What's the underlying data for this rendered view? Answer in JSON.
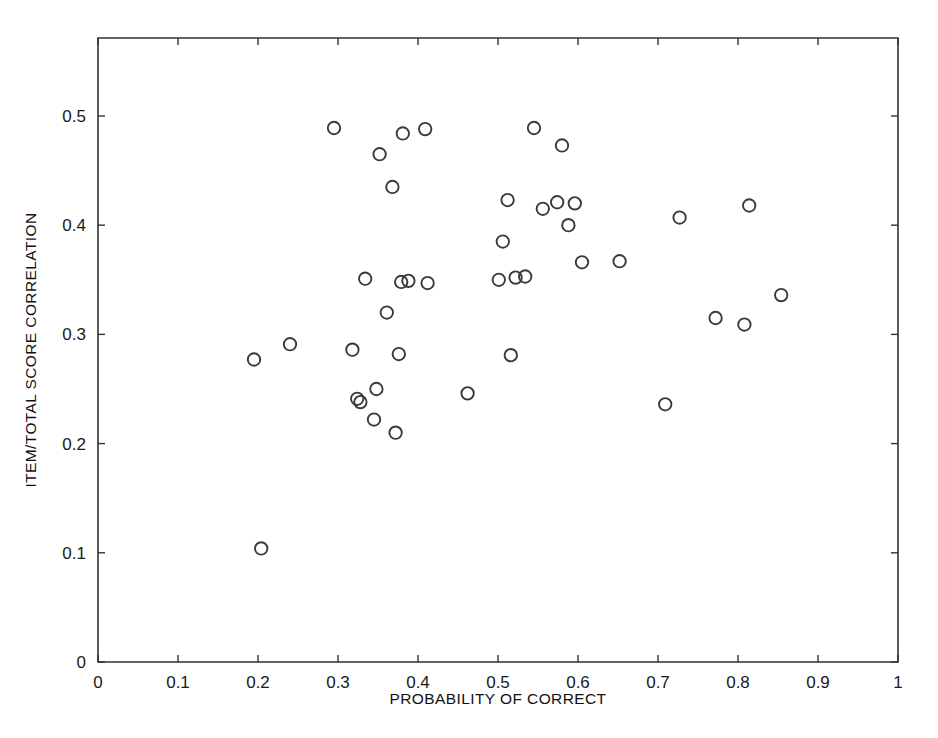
{
  "chart_data": {
    "type": "scatter",
    "title": "",
    "xlabel": "PROBABILITY OF CORRECT",
    "ylabel": "ITEM/TOTAL SCORE CORRELATION",
    "xlim": [
      0,
      1
    ],
    "ylim": [
      0,
      0.5714
    ],
    "grid": false,
    "legend": null,
    "marker": "open-circle",
    "marker_color": "#3a3a3a",
    "xticks": [
      0,
      0.1,
      0.2,
      0.3,
      0.4,
      0.5,
      0.6,
      0.7,
      0.8,
      0.9,
      1
    ],
    "xtick_labels": [
      "0",
      "0.1",
      "0.2",
      "0.3",
      "0.4",
      "0.5",
      "0.6",
      "0.7",
      "0.8",
      "0.9",
      "1"
    ],
    "yticks": [
      0,
      0.1,
      0.2,
      0.3,
      0.4,
      0.5
    ],
    "ytick_labels": [
      "0",
      "0.1",
      "0.2",
      "0.3",
      "0.4",
      "0.5"
    ],
    "n_points": 41,
    "x": [
      0.195,
      0.204,
      0.24,
      0.295,
      0.318,
      0.324,
      0.328,
      0.334,
      0.345,
      0.348,
      0.352,
      0.361,
      0.368,
      0.372,
      0.376,
      0.379,
      0.381,
      0.388,
      0.409,
      0.412,
      0.462,
      0.501,
      0.506,
      0.512,
      0.516,
      0.522,
      0.534,
      0.545,
      0.556,
      0.574,
      0.58,
      0.588,
      0.596,
      0.605,
      0.652,
      0.709,
      0.727,
      0.772,
      0.808,
      0.814,
      0.854
    ],
    "y": [
      0.277,
      0.104,
      0.291,
      0.489,
      0.286,
      0.241,
      0.238,
      0.351,
      0.222,
      0.25,
      0.465,
      0.32,
      0.435,
      0.21,
      0.282,
      0.348,
      0.484,
      0.349,
      0.488,
      0.347,
      0.246,
      0.35,
      0.385,
      0.423,
      0.281,
      0.352,
      0.353,
      0.489,
      0.415,
      0.421,
      0.473,
      0.4,
      0.42,
      0.366,
      0.367,
      0.236,
      0.407,
      0.315,
      0.309,
      0.418,
      0.336
    ],
    "points": [
      {
        "x": 0.195,
        "y": 0.277
      },
      {
        "x": 0.204,
        "y": 0.104
      },
      {
        "x": 0.24,
        "y": 0.291
      },
      {
        "x": 0.295,
        "y": 0.489
      },
      {
        "x": 0.318,
        "y": 0.286
      },
      {
        "x": 0.324,
        "y": 0.241
      },
      {
        "x": 0.328,
        "y": 0.238
      },
      {
        "x": 0.334,
        "y": 0.351
      },
      {
        "x": 0.345,
        "y": 0.222
      },
      {
        "x": 0.348,
        "y": 0.25
      },
      {
        "x": 0.352,
        "y": 0.465
      },
      {
        "x": 0.361,
        "y": 0.32
      },
      {
        "x": 0.368,
        "y": 0.435
      },
      {
        "x": 0.372,
        "y": 0.21
      },
      {
        "x": 0.376,
        "y": 0.282
      },
      {
        "x": 0.379,
        "y": 0.348
      },
      {
        "x": 0.381,
        "y": 0.484
      },
      {
        "x": 0.388,
        "y": 0.349
      },
      {
        "x": 0.409,
        "y": 0.488
      },
      {
        "x": 0.412,
        "y": 0.347
      },
      {
        "x": 0.462,
        "y": 0.246
      },
      {
        "x": 0.501,
        "y": 0.35
      },
      {
        "x": 0.506,
        "y": 0.385
      },
      {
        "x": 0.512,
        "y": 0.423
      },
      {
        "x": 0.516,
        "y": 0.281
      },
      {
        "x": 0.522,
        "y": 0.352
      },
      {
        "x": 0.534,
        "y": 0.353
      },
      {
        "x": 0.545,
        "y": 0.489
      },
      {
        "x": 0.556,
        "y": 0.415
      },
      {
        "x": 0.574,
        "y": 0.421
      },
      {
        "x": 0.58,
        "y": 0.473
      },
      {
        "x": 0.588,
        "y": 0.4
      },
      {
        "x": 0.596,
        "y": 0.42
      },
      {
        "x": 0.605,
        "y": 0.366
      },
      {
        "x": 0.652,
        "y": 0.367
      },
      {
        "x": 0.709,
        "y": 0.236
      },
      {
        "x": 0.727,
        "y": 0.407
      },
      {
        "x": 0.772,
        "y": 0.315
      },
      {
        "x": 0.808,
        "y": 0.309
      },
      {
        "x": 0.814,
        "y": 0.418
      },
      {
        "x": 0.854,
        "y": 0.336
      }
    ]
  }
}
